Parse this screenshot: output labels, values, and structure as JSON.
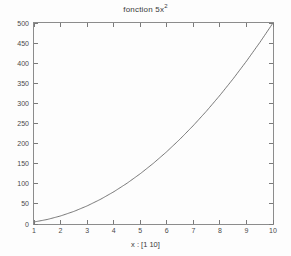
{
  "chart_data": {
    "type": "line",
    "title_base": "fonction 5x",
    "title_sup": "2",
    "xlabel": "x : [1  10]",
    "ylabel": "",
    "xlim": [
      1,
      10
    ],
    "ylim": [
      0,
      500
    ],
    "grid": false,
    "legend": null,
    "series": [
      {
        "name": "5x^2",
        "color": "#555555",
        "x": [
          1,
          1.5,
          2,
          2.5,
          3,
          3.5,
          4,
          4.5,
          5,
          5.5,
          6,
          6.5,
          7,
          7.5,
          8,
          8.5,
          9,
          9.5,
          10
        ],
        "values": [
          5,
          11.25,
          20,
          31.25,
          45,
          61.25,
          80,
          101.25,
          125,
          151.25,
          180,
          211.25,
          245,
          281.25,
          320,
          361.25,
          405,
          451.25,
          500
        ]
      }
    ],
    "x_ticks": [
      1,
      2,
      3,
      4,
      5,
      6,
      7,
      8,
      9,
      10
    ],
    "x_tick_labels": [
      "1",
      "2",
      "3",
      "4",
      "5",
      "6",
      "7",
      "8",
      "9",
      "10"
    ],
    "y_ticks": [
      0,
      50,
      100,
      150,
      200,
      250,
      300,
      350,
      400,
      450,
      500
    ],
    "y_tick_labels": [
      "0",
      "50",
      "100",
      "150",
      "200",
      "250",
      "300",
      "350",
      "400",
      "450",
      "500"
    ],
    "axis_color": "#8c8c8c",
    "tick_color": "#7a7a7a",
    "text_color": "#4a4a4a",
    "background": "#fdfdfd"
  }
}
